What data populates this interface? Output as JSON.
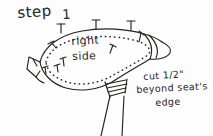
{
  "page": {
    "kind": "hand-drawn instructional sketch",
    "background_color": "#fdfdfd",
    "ink_color": "#26221f"
  },
  "heading": {
    "label": "step",
    "number": "1"
  },
  "labels": {
    "right": "right",
    "side": "side",
    "cut": "cut 1/2\"",
    "beyond": "beyond seat's",
    "edge": "edge"
  },
  "drawing": {
    "subject": "bicycle-seat-cover",
    "parts": [
      {
        "name": "seat-outline",
        "description": "teardrop bicycle saddle seen from above"
      },
      {
        "name": "seat-nose",
        "description": "pointed right end with folded layers"
      },
      {
        "name": "rear-tab",
        "description": "flared tab at left rear of saddle"
      },
      {
        "name": "cut-line",
        "description": "dotted line inset from saddle edge"
      },
      {
        "name": "seat-post",
        "description": "two diverging lines below saddle"
      },
      {
        "name": "post-clamp",
        "description": "coiled spring clamp at top of post"
      }
    ],
    "pin_count_top": 3,
    "pin_count_inner": 6
  }
}
